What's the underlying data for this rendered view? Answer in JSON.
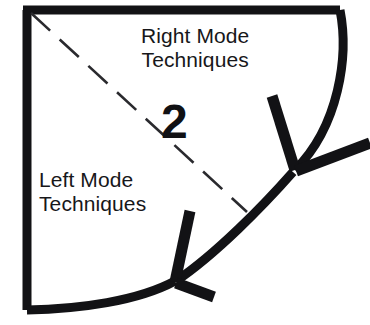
{
  "figure": {
    "kind": "chapter-opener-diagram",
    "chapter_number": "2",
    "stroke_color": "#121215",
    "background_color": "#ffffff",
    "labels": {
      "right_mode": {
        "line1": "Right Mode",
        "line2": "Techniques"
      },
      "left_mode": {
        "line1": "Left Mode",
        "line2": "Techniques"
      }
    },
    "elements": {
      "frame_name": "page-corner-frame",
      "divider_name": "dashed-diagonal-divider",
      "arrow_upper_name": "arrow-to-right-mode",
      "arrow_lower_name": "arrow-to-left-mode"
    }
  }
}
